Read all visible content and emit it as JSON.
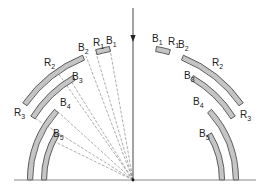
{
  "diagram": {
    "origin": {
      "x": 133,
      "y": 180
    },
    "baseline": {
      "x1": 14,
      "x2": 256,
      "y": 180
    },
    "incident_arrow": {
      "x": 133,
      "y_start": 8,
      "y_end": 180,
      "head_y": 42
    },
    "colors": {
      "stroke": "#3a3a3a",
      "fill": "#c8c8c8",
      "ray": "#777777",
      "text": "#222222"
    },
    "left_segments": [
      {
        "id": "R1-B1",
        "r": 133,
        "a1": 106,
        "a2": 100
      },
      {
        "id": "R2-B2",
        "r": 132,
        "a1": 145,
        "a2": 112
      },
      {
        "id": "R3-B3",
        "r": 118,
        "a1": 148,
        "a2": 120
      },
      {
        "id": "R3-B4-outer",
        "r": 103,
        "a1": 180,
        "a2": 138
      },
      {
        "id": "B5-inner",
        "r": 89,
        "a1": 180,
        "a2": 149
      }
    ],
    "right_segments": [
      {
        "id": "B1-R1",
        "r": 133,
        "a1": 80,
        "a2": 74
      },
      {
        "id": "B2-R2",
        "r": 132,
        "a1": 68,
        "a2": 35
      },
      {
        "id": "B3-R3",
        "r": 118,
        "a1": 60,
        "a2": 32
      },
      {
        "id": "B4-outer",
        "r": 103,
        "a1": 42,
        "a2": 0
      },
      {
        "id": "B5-inner",
        "r": 89,
        "a1": 31,
        "a2": 0
      }
    ],
    "rays": [
      {
        "to_x": 110,
        "to_y": 49
      },
      {
        "to_x": 96,
        "to_y": 53
      },
      {
        "to_x": 86,
        "to_y": 56
      },
      {
        "to_x": 69,
        "to_y": 78
      },
      {
        "to_x": 58,
        "to_y": 73
      },
      {
        "to_x": 57,
        "to_y": 111
      },
      {
        "to_x": 33,
        "to_y": 117
      },
      {
        "to_x": 51,
        "to_y": 140
      }
    ],
    "labels": {
      "left": [
        {
          "base": "B",
          "sub": "1",
          "x": 106,
          "y": 44
        },
        {
          "base": "R",
          "sub": "1",
          "x": 93,
          "y": 46
        },
        {
          "base": "B",
          "sub": "2",
          "x": 78,
          "y": 51
        },
        {
          "base": "R",
          "sub": "2",
          "x": 44,
          "y": 66
        },
        {
          "base": "B",
          "sub": "3",
          "x": 72,
          "y": 80
        },
        {
          "base": "R",
          "sub": "3",
          "x": 14,
          "y": 116
        },
        {
          "base": "B",
          "sub": "4",
          "x": 60,
          "y": 106
        },
        {
          "base": "B",
          "sub": "5",
          "x": 53,
          "y": 137
        }
      ],
      "right": [
        {
          "base": "B",
          "sub": "1",
          "x": 152,
          "y": 42
        },
        {
          "base": "R",
          "sub": "1",
          "x": 168,
          "y": 45
        },
        {
          "base": "B",
          "sub": "2",
          "x": 178,
          "y": 48
        },
        {
          "base": "R",
          "sub": "2",
          "x": 212,
          "y": 66
        },
        {
          "base": "B",
          "sub": "3",
          "x": 184,
          "y": 79
        },
        {
          "base": "R",
          "sub": "3",
          "x": 240,
          "y": 118
        },
        {
          "base": "B",
          "sub": "4",
          "x": 193,
          "y": 105
        },
        {
          "base": "B",
          "sub": "5",
          "x": 199,
          "y": 137
        }
      ]
    }
  }
}
